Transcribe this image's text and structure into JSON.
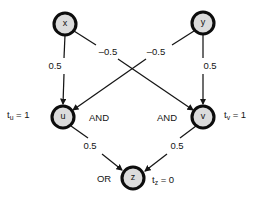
{
  "diagram": {
    "colors": {
      "node_fill": "#dcdcdc",
      "node_stroke": "#0d0d0d",
      "edge_stroke": "#151515",
      "background": "#ffffff"
    },
    "nodes": [
      {
        "id": "x",
        "label": "x",
        "cx": 65,
        "cy": 24,
        "r": 11
      },
      {
        "id": "y",
        "label": "y",
        "cx": 203,
        "cy": 23,
        "r": 11
      },
      {
        "id": "u",
        "label": "u",
        "cx": 63,
        "cy": 117,
        "r": 11
      },
      {
        "id": "v",
        "label": "v",
        "cx": 203,
        "cy": 117,
        "r": 11
      },
      {
        "id": "z",
        "label": "z",
        "cx": 133,
        "cy": 178,
        "r": 11
      }
    ],
    "edges": [
      {
        "id": "x-u",
        "from": "x",
        "to": "u",
        "weight": "0.5",
        "label_x": 55,
        "label_y": 66
      },
      {
        "id": "x-v",
        "from": "x",
        "to": "v",
        "weight": "–0.5",
        "label_x": 108,
        "label_y": 52
      },
      {
        "id": "y-u",
        "from": "y",
        "to": "u",
        "weight": "–0.5",
        "label_x": 156,
        "label_y": 52
      },
      {
        "id": "y-v",
        "from": "y",
        "to": "v",
        "weight": "0.5",
        "label_x": 210,
        "label_y": 66
      },
      {
        "id": "u-z",
        "from": "u",
        "to": "z",
        "weight": "0.5",
        "label_x": 90,
        "label_y": 146
      },
      {
        "id": "v-z",
        "from": "v",
        "to": "z",
        "weight": "0.5",
        "label_x": 177,
        "label_y": 146
      }
    ],
    "gate_labels": [
      {
        "id": "gate-u",
        "text": "AND",
        "x": 99,
        "y": 118
      },
      {
        "id": "gate-v",
        "text": "AND",
        "x": 167,
        "y": 118
      },
      {
        "id": "gate-z",
        "text": "OR",
        "x": 104,
        "y": 179
      }
    ],
    "thresholds": [
      {
        "id": "t-u",
        "prefix": "t",
        "sub": "u",
        "rest": " = 1",
        "x": 7,
        "y": 115
      },
      {
        "id": "t-v",
        "prefix": "t",
        "sub": "v",
        "rest": " = 1",
        "x": 224,
        "y": 115
      },
      {
        "id": "t-z",
        "prefix": "t",
        "sub": "z",
        "rest": " = 0",
        "x": 152,
        "y": 180
      }
    ]
  }
}
